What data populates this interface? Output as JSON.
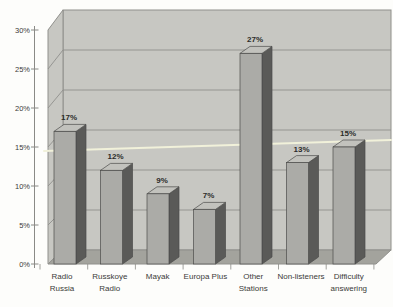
{
  "chart_data": {
    "type": "bar",
    "style": "3d-column",
    "title": "",
    "xlabel": "",
    "ylabel": "",
    "categories": [
      "Radio Russia",
      "Russkoye Radio",
      "Mayak",
      "Europa Plus",
      "Other Stations",
      "Non-listeners",
      "Difficulty answering"
    ],
    "category_label_lines": [
      [
        "Radio",
        "Russia"
      ],
      [
        "Russkoye",
        "Radio"
      ],
      [
        "Mayak"
      ],
      [
        "Europa Plus"
      ],
      [
        "Other",
        "Stations"
      ],
      [
        "Non-listeners"
      ],
      [
        "Difficulty",
        "answering"
      ]
    ],
    "values": [
      17,
      12,
      9,
      7,
      27,
      13,
      15
    ],
    "data_labels": [
      "17%",
      "12%",
      "9%",
      "7%",
      "27%",
      "13%",
      "15%"
    ],
    "ylim": [
      0,
      30
    ],
    "y_tick_interval": 5,
    "y_tick_labels": [
      "0%",
      "5%",
      "10%",
      "15%",
      "20%",
      "25%",
      "30%"
    ],
    "grid": true,
    "legend": "none",
    "reference_line": {
      "name": "average-line",
      "approx_value": 14.3
    }
  },
  "colors": {
    "background": "#fdfdfb",
    "wall": "#c7c7c2",
    "floor": "#a3a39d",
    "grid_line": "#90908c",
    "axis_line": "#8a8a86",
    "bar_front": "#ababa7",
    "bar_side": "#5a5a58",
    "bar_top": "#c2c2bd",
    "bar_stroke": "#4c4c4a",
    "label_text": "#3b3b39",
    "data_label_text": "#2b2b29",
    "reference_line": "#f1f1da"
  }
}
